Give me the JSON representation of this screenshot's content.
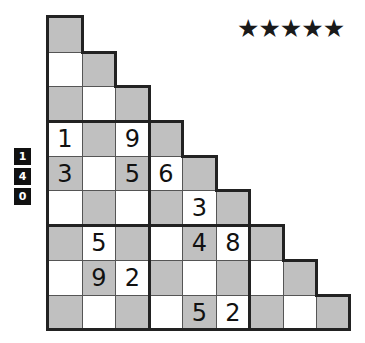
{
  "difficulty": {
    "stars": "★★★★★",
    "count": 5
  },
  "side_badges": [
    "1",
    "4",
    "0"
  ],
  "puzzle": {
    "type": "staircase-sudoku",
    "rows": 9,
    "cols": 9,
    "shade_color": "#c0c0c0",
    "cells": [
      [
        "",
        null,
        null,
        null,
        null,
        null,
        null,
        null,
        null
      ],
      [
        "",
        "",
        null,
        null,
        null,
        null,
        null,
        null,
        null
      ],
      [
        "",
        "",
        "",
        null,
        null,
        null,
        null,
        null,
        null
      ],
      [
        "1",
        "",
        "9",
        "",
        null,
        null,
        null,
        null,
        null
      ],
      [
        "3",
        "",
        "5",
        "6",
        "",
        null,
        null,
        null,
        null
      ],
      [
        "",
        "",
        "",
        "",
        "3",
        "",
        null,
        null,
        null
      ],
      [
        "",
        "5",
        "",
        "",
        "4",
        "8",
        "",
        null,
        null
      ],
      [
        "",
        "9",
        "2",
        "",
        "",
        "",
        "",
        "",
        null
      ],
      [
        "",
        "",
        "",
        "",
        "5",
        "2",
        "",
        "",
        ""
      ]
    ]
  }
}
